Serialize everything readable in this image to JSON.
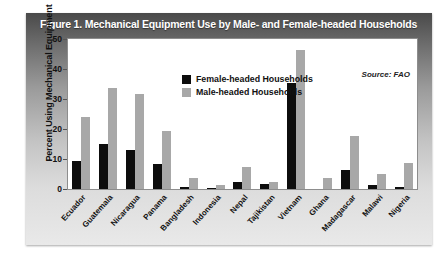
{
  "figure": {
    "title": "Figure 1.  Mechanical Equipment Use by Male- and Female-headed Households",
    "source": "Source: FAO"
  },
  "colors": {
    "female_bar": "#0d0d0d",
    "male_bar": "#a8a8a8",
    "panel_top": "#4a4a4a",
    "panel_bottom": "#e9e9e9",
    "plot_background": "#ffffff",
    "title_text": "#ffffff"
  },
  "legend": {
    "position": "inside-top-center",
    "entries": [
      {
        "label": "Female-headed Households",
        "color": "#0d0d0d"
      },
      {
        "label": "Male-headed Households",
        "color": "#a8a8a8"
      }
    ]
  },
  "chart_data": {
    "type": "bar",
    "title": "Figure 1.  Mechanical Equipment Use by Male- and Female-headed Households",
    "subtitle": "",
    "xlabel": "",
    "ylabel": "Percent Using Mechanical Equipment",
    "ylim": [
      0,
      50
    ],
    "yticks": [
      0,
      10,
      20,
      30,
      40,
      50
    ],
    "ytick_labels": [
      "0",
      "10",
      "20",
      "30",
      "40",
      "50"
    ],
    "grid": false,
    "legend_position": "upper center",
    "annotations": [
      "Source: FAO"
    ],
    "categories": [
      "Ecuador",
      "Guatemala",
      "Nicaragua",
      "Panama",
      "Bangladesh",
      "Indonesia",
      "Nepal",
      "Tajikistan",
      "Vietnam",
      "Ghana",
      "Madagascar",
      "Malawi",
      "Nigeria"
    ],
    "series": [
      {
        "name": "Female-headed Households",
        "color": "#0d0d0d",
        "values": [
          9.5,
          15.0,
          13.0,
          8.5,
          0.8,
          0.5,
          2.2,
          1.8,
          35.5,
          0.0,
          6.5,
          1.5,
          0.7
        ]
      },
      {
        "name": "Male-headed Households",
        "color": "#a8a8a8",
        "values": [
          24.0,
          34.0,
          32.0,
          19.5,
          3.8,
          1.5,
          7.3,
          2.3,
          46.5,
          3.8,
          17.8,
          5.0,
          8.7
        ]
      }
    ]
  }
}
